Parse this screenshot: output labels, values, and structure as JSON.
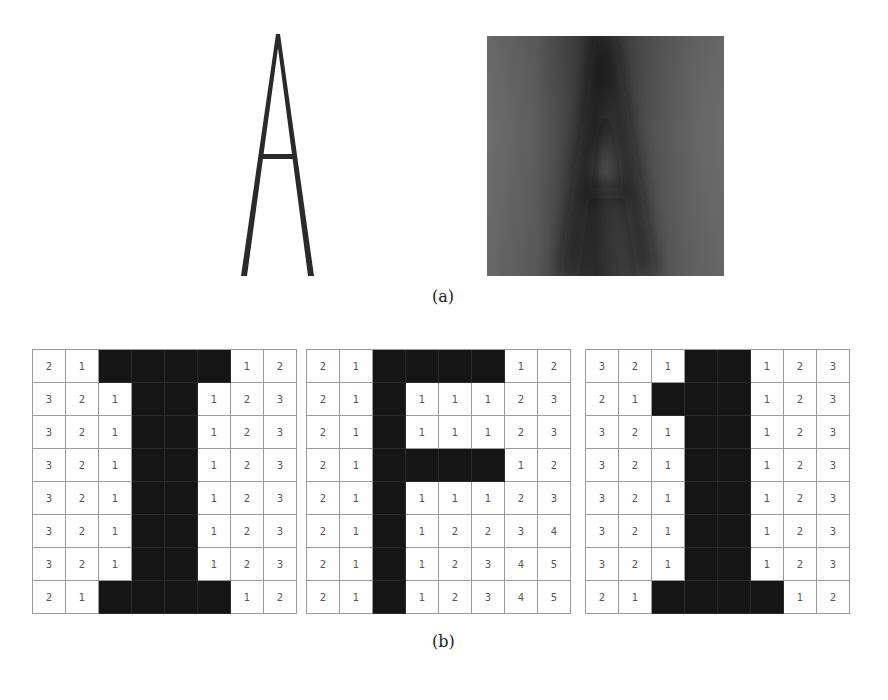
{
  "figure": {
    "panel_a": {
      "caption": "(a)",
      "left_image": "sharp letter A (binary)",
      "right_image": "blurred noisy letter A"
    },
    "panel_b": {
      "caption": "(b)",
      "grids": [
        {
          "name": "letter-I",
          "cells": [
            [
              "2",
              "1",
              "#",
              "#",
              "#",
              "#",
              "1",
              "2"
            ],
            [
              "3",
              "2",
              "1",
              "#",
              "#",
              "1",
              "2",
              "3"
            ],
            [
              "3",
              "2",
              "1",
              "#",
              "#",
              "1",
              "2",
              "3"
            ],
            [
              "3",
              "2",
              "1",
              "#",
              "#",
              "1",
              "2",
              "3"
            ],
            [
              "3",
              "2",
              "1",
              "#",
              "#",
              "1",
              "2",
              "3"
            ],
            [
              "3",
              "2",
              "1",
              "#",
              "#",
              "1",
              "2",
              "3"
            ],
            [
              "3",
              "2",
              "1",
              "#",
              "#",
              "1",
              "2",
              "3"
            ],
            [
              "2",
              "1",
              "#",
              "#",
              "#",
              "#",
              "1",
              "2"
            ]
          ]
        },
        {
          "name": "letter-F",
          "cells": [
            [
              "2",
              "1",
              "#",
              "#",
              "#",
              "#",
              "1",
              "2"
            ],
            [
              "2",
              "1",
              "#",
              "1",
              "1",
              "1",
              "2",
              "3"
            ],
            [
              "2",
              "1",
              "#",
              "1",
              "1",
              "1",
              "2",
              "3"
            ],
            [
              "2",
              "1",
              "#",
              "#",
              "#",
              "#",
              "1",
              "2"
            ],
            [
              "2",
              "1",
              "#",
              "1",
              "1",
              "1",
              "2",
              "3"
            ],
            [
              "2",
              "1",
              "#",
              "1",
              "2",
              "2",
              "3",
              "4"
            ],
            [
              "2",
              "1",
              "#",
              "1",
              "2",
              "3",
              "4",
              "5"
            ],
            [
              "2",
              "1",
              "#",
              "1",
              "2",
              "3",
              "4",
              "5"
            ]
          ]
        },
        {
          "name": "digit-1",
          "cells": [
            [
              "3",
              "2",
              "1",
              "#",
              "#",
              "1",
              "2",
              "3"
            ],
            [
              "2",
              "1",
              "#",
              "#",
              "#",
              "1",
              "2",
              "3"
            ],
            [
              "3",
              "2",
              "1",
              "#",
              "#",
              "1",
              "2",
              "3"
            ],
            [
              "3",
              "2",
              "1",
              "#",
              "#",
              "1",
              "2",
              "3"
            ],
            [
              "3",
              "2",
              "1",
              "#",
              "#",
              "1",
              "2",
              "3"
            ],
            [
              "3",
              "2",
              "1",
              "#",
              "#",
              "1",
              "2",
              "3"
            ],
            [
              "3",
              "2",
              "1",
              "#",
              "#",
              "1",
              "2",
              "3"
            ],
            [
              "2",
              "1",
              "#",
              "#",
              "#",
              "#",
              "1",
              "2"
            ]
          ]
        }
      ]
    }
  }
}
